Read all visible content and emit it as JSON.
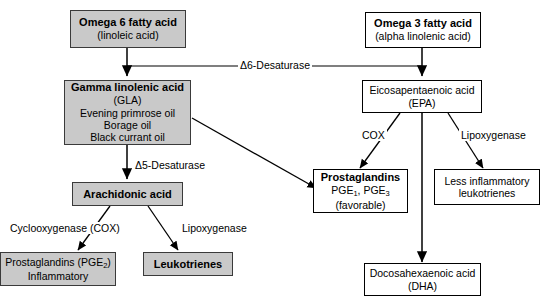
{
  "diagram": {
    "colors": {
      "shaded_fill": "#c9c9c9",
      "box_stroke": "#000000",
      "arrow": "#000000",
      "background": "#ffffff"
    },
    "boxes": {
      "omega6": {
        "line1": "Omega 6 fatty acid",
        "line2": "(linoleic acid)",
        "fill": "shaded"
      },
      "gla": {
        "line1": "Gamma linolenic acid",
        "line2": "(GLA)",
        "line3": "Evening primrose oil",
        "line4": "Borage oil",
        "line5": "Black currant oil",
        "fill": "shaded"
      },
      "arachidonic": {
        "line1": "Arachidonic acid",
        "fill": "shaded"
      },
      "pge2": {
        "line1": "Prostaglandins (PGE",
        "sub1": "2",
        "line1b": ")",
        "line2": "Inflammatory",
        "fill": "shaded"
      },
      "leukotrienes": {
        "line1": "Leukotrienes",
        "fill": "shaded"
      },
      "omega3": {
        "line1": "Omega 3 fatty acid",
        "line2": "(alpha linolenic acid)",
        "fill": "white"
      },
      "epa": {
        "line1": "Eicosapentaenoic acid",
        "line2": "(EPA)",
        "fill": "white"
      },
      "pge13": {
        "line1": "Prostaglandins",
        "line2a": "PGE",
        "sub2a": "1",
        "line2b": ", PGE",
        "sub2b": "3",
        "line3": "(favorable)",
        "fill": "white"
      },
      "less_inflam": {
        "line1": "Less inflammatory",
        "line2": "leukotrienes",
        "fill": "white"
      },
      "dha": {
        "line1": "Docosahexaenoic acid",
        "line2": "(DHA)",
        "fill": "white"
      }
    },
    "enzyme_labels": {
      "d6": "Δ6-Desaturase",
      "d5": "Δ5-Desaturase",
      "cox_left_1": "Cyclooxygenase",
      "cox_left_2": "(COX)",
      "lipox_left": "Lipoxygenase",
      "cox_right": "COX",
      "lipox_right": "Lipoxygenase"
    }
  }
}
